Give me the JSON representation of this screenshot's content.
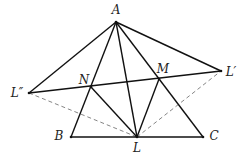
{
  "diagram": {
    "type": "geometry",
    "points": {
      "A": {
        "label": "A",
        "x": 116,
        "y": 22,
        "lx": 116,
        "ly": 14
      },
      "B": {
        "label": "B",
        "x": 71,
        "y": 137,
        "lx": 59,
        "ly": 140
      },
      "C": {
        "label": "C",
        "x": 203,
        "y": 137,
        "lx": 214,
        "ly": 140
      },
      "L": {
        "label": "L",
        "x": 137,
        "y": 137,
        "lx": 137,
        "ly": 152
      },
      "M": {
        "label": "M",
        "x": 159,
        "y": 79,
        "lx": 163,
        "ly": 73
      },
      "N": {
        "label": "N",
        "x": 91,
        "y": 87,
        "lx": 84,
        "ly": 84
      },
      "L1": {
        "label": "L′",
        "x": 221,
        "y": 71,
        "lx": 231,
        "ly": 76
      },
      "L2": {
        "label": "L″",
        "x": 29,
        "y": 93,
        "lx": 17,
        "ly": 97
      }
    },
    "solid_segments": [
      [
        "A",
        "B"
      ],
      [
        "A",
        "C"
      ],
      [
        "B",
        "C"
      ],
      [
        "A",
        "L"
      ],
      [
        "A",
        "L1"
      ],
      [
        "A",
        "L2"
      ],
      [
        "L2",
        "L1"
      ],
      [
        "N",
        "L"
      ],
      [
        "M",
        "L"
      ]
    ],
    "dashed_segments": [
      [
        "L2",
        "L"
      ],
      [
        "L",
        "L1"
      ]
    ],
    "colors": {
      "line": "#111111",
      "dash": "#777777"
    }
  }
}
